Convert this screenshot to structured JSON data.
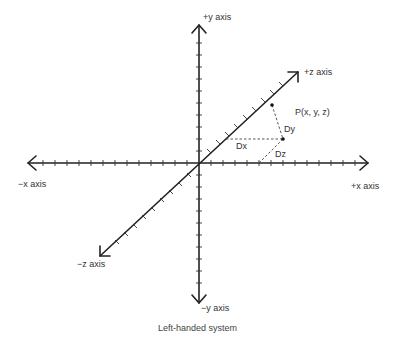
{
  "diagram": {
    "caption": "Left-handed system",
    "axes": {
      "pos_y": "+y axis",
      "neg_y": "−y axis",
      "pos_x": "+x axis",
      "neg_x": "−x axis",
      "pos_z": "+z axis",
      "neg_z": "−z axis"
    },
    "point_label": "P(x, y, z)",
    "distance_labels": {
      "dx": "Dx",
      "dy": "Dy",
      "dz": "Dz"
    },
    "colors": {
      "axis": "#222222",
      "dashed": "#444444",
      "text": "#333333",
      "background": "#ffffff"
    }
  }
}
